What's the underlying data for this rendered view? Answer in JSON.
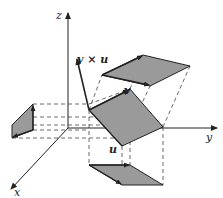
{
  "diagram": {
    "title": "",
    "colors": {
      "background": "#ffffff",
      "fill": "#9a9a9a",
      "stroke": "#222222",
      "dashed": "#444444"
    },
    "labels": {
      "z_axis": "z",
      "y_axis": "y",
      "x_axis": "x",
      "cross_product": "v × u",
      "vector_v": "v",
      "vector_u": "u"
    },
    "axes": {
      "origin": [
        68,
        128
      ],
      "z_end": [
        68,
        12
      ],
      "y_end": [
        218,
        128
      ],
      "x_end": [
        10,
        190
      ]
    },
    "parallelograms": [
      {
        "name": "parallelogram-original",
        "points": [
          [
            89,
            110
          ],
          [
            130,
            89
          ],
          [
            163,
            127
          ],
          [
            122,
            146
          ]
        ]
      },
      {
        "name": "projection-yz-plane",
        "points": [
          [
            102,
            75
          ],
          [
            143,
            55
          ],
          [
            190,
            66
          ],
          [
            150,
            86
          ]
        ]
      },
      {
        "name": "projection-xz-plane",
        "points": [
          [
            12,
            125
          ],
          [
            33,
            104
          ],
          [
            33,
            130
          ],
          [
            12,
            138
          ]
        ]
      },
      {
        "name": "projection-xy-plane",
        "points": [
          [
            89,
            165
          ],
          [
            130,
            165
          ],
          [
            163,
            185
          ],
          [
            122,
            185
          ]
        ]
      }
    ]
  }
}
